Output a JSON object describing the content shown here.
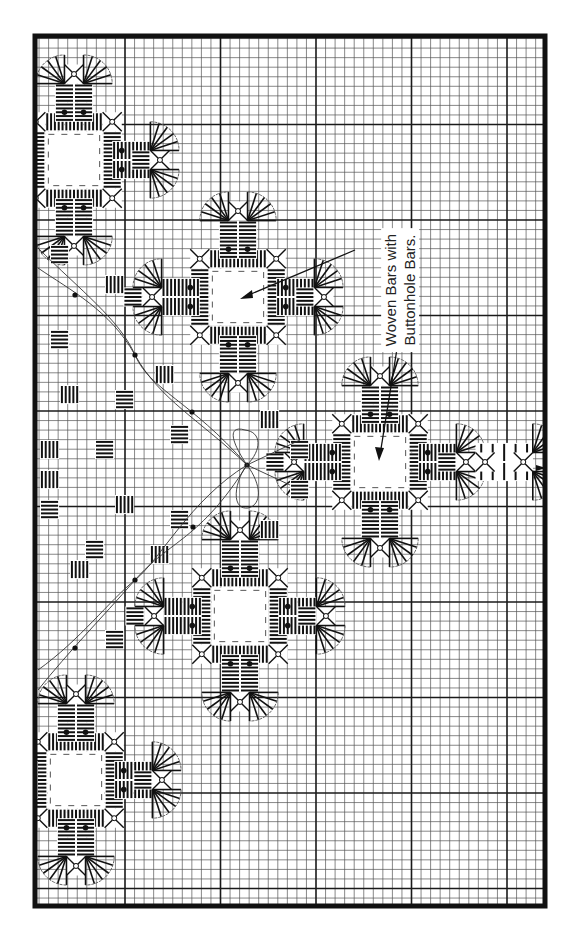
{
  "figure": {
    "type": "hardanger-embroidery-chart",
    "orientation": "rotated",
    "annotation": {
      "line1": "Woven Bars with",
      "line2": "Buttonhole Bars."
    },
    "grid": {
      "minor_per_major": 10,
      "line_color": "#555555",
      "major_color": "#1a1a1a",
      "frame_color": "#111111"
    },
    "legend_symbols": [
      {
        "name": "kloster-block",
        "description": "satin stitch bars"
      },
      {
        "name": "dove-eye",
        "description": "dove's eye filling"
      },
      {
        "name": "buttonhole-fan",
        "description": "buttonhole scallop"
      },
      {
        "name": "french-knot",
        "description": "dot"
      },
      {
        "name": "cut-area",
        "description": "dashed square"
      },
      {
        "name": "running-thread",
        "description": "curved vine line"
      },
      {
        "name": "flower",
        "description": "detached petals"
      }
    ],
    "center_marker": "arrow-right"
  }
}
